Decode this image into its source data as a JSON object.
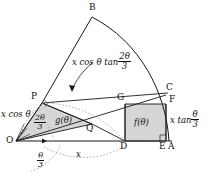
{
  "figure": {
    "colors": {
      "stroke": "#1a1a1a",
      "fill_shaded": "#d6d6d6",
      "dotted": "#999999",
      "background": "#ffffff"
    },
    "points": {
      "B": "B",
      "P": "P",
      "C": "C",
      "G": "G",
      "F": "F",
      "Q": "Q",
      "O": "O",
      "D": "D",
      "E": "E",
      "A": "A"
    },
    "labels": {
      "arc_label_num": "2θ",
      "arc_label_den": "3",
      "arc_label_prefix": "x cos θ tan",
      "left_side": "x cos θ",
      "angle_top_num": "2θ",
      "angle_top_den": "3",
      "angle_bottom_num": "θ",
      "angle_bottom_den": "3",
      "g_function": "g(θ)",
      "f_function": "f(θ)",
      "baseline_x": "x",
      "right_side_prefix": "x tan",
      "right_side_num": "θ",
      "right_side_den": "3"
    }
  }
}
